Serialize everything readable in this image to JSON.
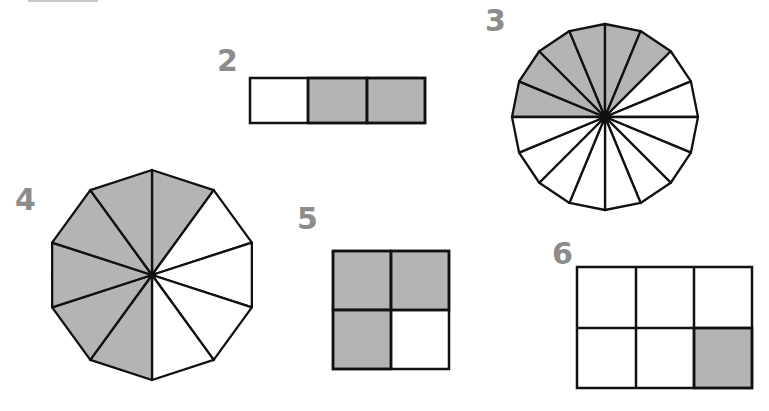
{
  "colors": {
    "shade": "#b4b4b4",
    "stroke": "#111111",
    "label": "#8c8c8c",
    "background": "#ffffff"
  },
  "figures": [
    {
      "number": "2",
      "shape": "rectangle-strip",
      "parts": 3,
      "shaded": 2,
      "shaded_cells": [
        1,
        2
      ]
    },
    {
      "number": "3",
      "shape": "16-gon",
      "parts": 16,
      "shaded": 6
    },
    {
      "number": "4",
      "shape": "10-gon",
      "parts": 10,
      "shaded": 6
    },
    {
      "number": "5",
      "shape": "2x2 square",
      "parts": 4,
      "shaded": 3,
      "shaded_cells": [
        0,
        1,
        2
      ]
    },
    {
      "number": "6",
      "shape": "2x3 rectangle",
      "parts": 6,
      "shaded": 1,
      "shaded_cells": [
        5
      ]
    }
  ]
}
